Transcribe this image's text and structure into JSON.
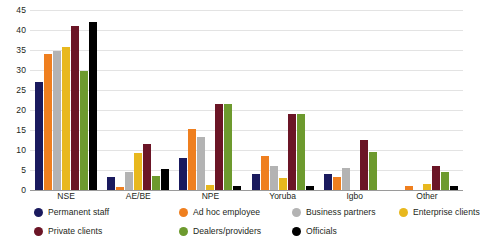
{
  "chart_data": {
    "type": "bar",
    "title": "",
    "subtitle": "",
    "xlabel": "",
    "ylabel": "",
    "ylim": [
      0,
      45
    ],
    "ytick_step": 5,
    "yticks": [
      0,
      5,
      10,
      15,
      20,
      25,
      30,
      35,
      40,
      45
    ],
    "grid": true,
    "legend_position": "bottom",
    "categories": [
      "NSE",
      "AE/BE",
      "NPE",
      "Yoruba",
      "Igbo",
      "Other"
    ],
    "series": [
      {
        "name": "Permanent staff",
        "color": "#1a1a5e",
        "values": [
          27.0,
          3.3,
          8.0,
          4.0,
          4.0,
          0.0
        ]
      },
      {
        "name": "Ad hoc employee",
        "color": "#ef7f1f",
        "values": [
          34.0,
          0.8,
          15.2,
          8.5,
          3.3,
          1.0
        ]
      },
      {
        "name": "Business partners",
        "color": "#b3b3b3",
        "values": [
          34.7,
          4.5,
          13.2,
          6.0,
          5.5,
          0.0
        ]
      },
      {
        "name": "Enterprise clients",
        "color": "#e8b81e",
        "values": [
          35.8,
          9.3,
          1.2,
          3.0,
          0.0,
          1.5
        ]
      },
      {
        "name": "Private clients",
        "color": "#6b1526",
        "values": [
          41.0,
          11.5,
          21.5,
          19.0,
          12.5,
          6.0
        ]
      },
      {
        "name": "Dealers/providers",
        "color": "#6d9a2e",
        "values": [
          29.7,
          3.5,
          21.5,
          19.0,
          9.5,
          4.5
        ]
      },
      {
        "name": "Officials",
        "color": "#000000",
        "values": [
          42.0,
          5.3,
          1.0,
          1.0,
          0.0,
          1.0
        ]
      }
    ]
  },
  "legend": {
    "items": [
      {
        "label": "Permanent staff",
        "color": "#1a1a5e"
      },
      {
        "label": "Ad hoc employee",
        "color": "#ef7f1f"
      },
      {
        "label": "Business partners",
        "color": "#b3b3b3"
      },
      {
        "label": "Enterprise clients",
        "color": "#e8b81e"
      },
      {
        "label": "Private clients",
        "color": "#6b1526"
      },
      {
        "label": "Dealers/providers",
        "color": "#6d9a2e"
      },
      {
        "label": "Officials",
        "color": "#000000"
      }
    ]
  }
}
